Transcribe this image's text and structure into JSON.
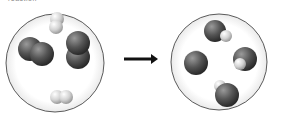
{
  "caption": "reaction",
  "diagram": {
    "type": "reaction-particle-diagram",
    "reactants": {
      "label": "before",
      "molecules": [
        {
          "kind": "dark-diatomic",
          "atoms": [
            "dark",
            "dark"
          ]
        },
        {
          "kind": "dark-diatomic",
          "atoms": [
            "dark",
            "dark"
          ]
        },
        {
          "kind": "light-diatomic",
          "atoms": [
            "light",
            "light"
          ]
        },
        {
          "kind": "light-diatomic",
          "atoms": [
            "light",
            "light"
          ]
        }
      ]
    },
    "arrow": "right-arrow",
    "products": {
      "label": "after",
      "molecules": [
        {
          "kind": "dark-light",
          "atoms": [
            "dark",
            "light"
          ]
        },
        {
          "kind": "dark-light",
          "atoms": [
            "dark",
            "light"
          ]
        },
        {
          "kind": "dark-light",
          "atoms": [
            "dark",
            "light"
          ]
        },
        {
          "kind": "dark-light",
          "atoms": [
            "dark",
            "light"
          ]
        }
      ]
    },
    "colors": {
      "dark_atom": "#555555",
      "light_atom": "#d4d4d4",
      "circle_stroke": "#333333",
      "arrow": "#111111"
    }
  }
}
